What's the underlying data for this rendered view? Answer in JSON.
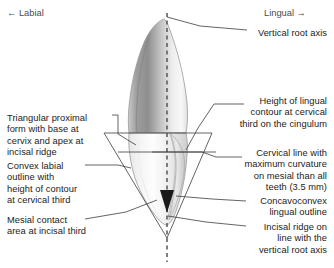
{
  "diagram": {
    "title_alt": "Maxillary central incisor, mesial (proximal) view with anatomical annotations",
    "background_color": "#ffffff",
    "text_color": "#1b1b1b",
    "direction_color": "#4a4a4a",
    "leader_line_color": "#3c3c3c",
    "axis_color": "#555555",
    "marker_color": "#1a1a1a",
    "tooth_outline_color": "#9a9a9a",
    "tooth_fill_light": "#fbfbfb",
    "tooth_fill_mid": "#d8d8d8",
    "tooth_fill_dark": "#8e8e8e"
  },
  "orientation": {
    "labial": "← Labial",
    "lingual": "Lingual →"
  },
  "annotations": {
    "left": [
      {
        "id": "triangular-proximal-form",
        "text": "Triangular proximal\nform with base at\ncervix and apex at\nincisal ridge"
      },
      {
        "id": "convex-labial-outline",
        "text": "Convex labial\noutline with\nheight of contour\nat cervical third"
      },
      {
        "id": "mesial-contact-area",
        "text": "Mesial contact\narea at incisal third"
      }
    ],
    "right": [
      {
        "id": "vertical-root-axis",
        "text": "Vertical root axis"
      },
      {
        "id": "height-lingual-contour",
        "text": "Height of lingual\ncontour at cervical\nthird on the cingulum"
      },
      {
        "id": "cervical-line-curvature",
        "text": "Cervical line with\nmaximum curvature\non mesial than all\nteeth (3.5 mm)"
      },
      {
        "id": "concavoconvex-lingual-outline",
        "text": "Concavoconvex\nlingual outline"
      },
      {
        "id": "incisal-ridge-on-axis",
        "text": "Incisal ridge on\nline with the\nvertical root axis"
      }
    ]
  }
}
